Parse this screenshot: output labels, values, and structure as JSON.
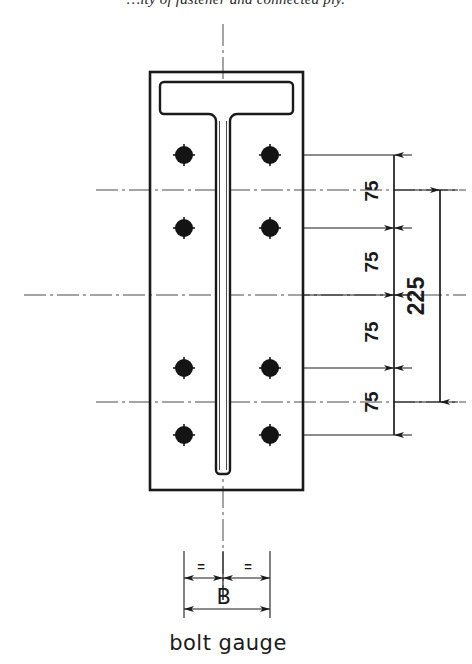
{
  "caption": {
    "text": "…ity of fastener and connected ply."
  },
  "figure": {
    "name": "bolt-gauge-detail-drawing",
    "type": "engineering-drawing",
    "view": "tee-section-with-bolt-group",
    "line_color": "#1a1a1a",
    "fill_color": "#ffffff",
    "bolt_fill": "#141414"
  },
  "drawing": {
    "plate": {
      "label": "outer-plate",
      "x": 150,
      "y": 72,
      "width": 153,
      "height": 418
    },
    "tee": {
      "label": "tee-section",
      "flange": {
        "x": 160,
        "y": 82,
        "width": 133,
        "height": 32
      },
      "web": {
        "x": 216,
        "y": 82,
        "width": 14,
        "height": 392
      },
      "fillet_radius": 7
    },
    "bolts": [
      {
        "name": "bolt-r1-left",
        "cx": 184,
        "cy": 155
      },
      {
        "name": "bolt-r1-right",
        "cx": 270,
        "cy": 155
      },
      {
        "name": "bolt-r2-left",
        "cx": 184,
        "cy": 228
      },
      {
        "name": "bolt-r2-right",
        "cx": 270,
        "cy": 228
      },
      {
        "name": "bolt-r3-left",
        "cx": 184,
        "cy": 368
      },
      {
        "name": "bolt-r3-right",
        "cx": 270,
        "cy": 368
      },
      {
        "name": "bolt-r4-left",
        "cx": 184,
        "cy": 435
      },
      {
        "name": "bolt-r4-right",
        "cx": 270,
        "cy": 435
      }
    ],
    "bolt_radius": 9,
    "bolt_tick": 11,
    "centerlines": {
      "vertical_main": {
        "x": 223,
        "y1": 24,
        "y2": 600
      },
      "horizontal_main": {
        "y": 295,
        "x1": 24,
        "x2": 466
      },
      "row_gap_1": {
        "y": 190,
        "x1": 96,
        "x2": 466
      },
      "row_gap_2": {
        "y": 402,
        "x1": 96,
        "x2": 466
      }
    }
  },
  "dimensions": {
    "vertical_chain": {
      "name": "pitch-dimension-chain",
      "line_x": 394,
      "segments": [
        {
          "label": "75",
          "y_from": 155,
          "y_to": 228
        },
        {
          "label": "75",
          "y_from": 228,
          "y_to": 295
        },
        {
          "label": "75",
          "y_from": 295,
          "y_to": 368
        },
        {
          "label": "75",
          "y_from": 368,
          "y_to": 435
        }
      ],
      "extension_lines": [
        {
          "y": 155,
          "x1": 303,
          "x2": 412
        },
        {
          "y": 228,
          "x1": 303,
          "x2": 412
        },
        {
          "y": 295,
          "x1": 303,
          "x2": 412
        },
        {
          "y": 368,
          "x1": 303,
          "x2": 412
        },
        {
          "y": 435,
          "x1": 303,
          "x2": 412
        }
      ]
    },
    "overall_vertical": {
      "name": "overall-depth-dimension",
      "label": "225",
      "line_x": 440,
      "y_from": 190,
      "y_to": 402,
      "extension_lines": [
        {
          "y": 190,
          "x1": 394,
          "x2": 458
        },
        {
          "y": 402,
          "x1": 394,
          "x2": 458
        }
      ]
    },
    "bolt_gauge": {
      "name": "bolt-gauge-dimension",
      "label": "B",
      "sub_label": "bolt gauge",
      "equal_marks": [
        "=",
        "="
      ],
      "left_x": 184,
      "center_x": 223,
      "right_x": 270,
      "half_dim_y": 578,
      "full_dim_y": 609,
      "extension_top_y": 551,
      "extension_bottom_y": 618
    }
  }
}
